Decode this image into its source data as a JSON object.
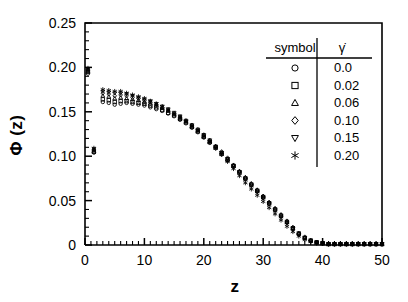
{
  "figure": {
    "background": "#ffffff",
    "foreground": "#000000"
  },
  "axes": {
    "x_label": "z",
    "y_label": "Φ (z)",
    "x_ticks": [
      "0",
      "10",
      "20",
      "30",
      "40",
      "50"
    ],
    "y_ticks": [
      "0",
      "0.05",
      "0.10",
      "0.15",
      "0.20",
      "0.25"
    ]
  },
  "legend": {
    "header_symbol": "symbol",
    "header_value": "γ̇",
    "rows": [
      {
        "marker": "circle-marker",
        "value": "0.0"
      },
      {
        "marker": "square-marker",
        "value": "0.02"
      },
      {
        "marker": "triangle-up-marker",
        "value": "0.06"
      },
      {
        "marker": "diamond-marker",
        "value": "0.10"
      },
      {
        "marker": "triangle-down-marker",
        "value": "0.15"
      },
      {
        "marker": "asterisk-marker",
        "value": "0.20"
      }
    ]
  },
  "chart_data": {
    "type": "scatter",
    "title": "",
    "xlabel": "z",
    "ylabel": "Φ (z)",
    "xlim": [
      0,
      50
    ],
    "ylim": [
      0,
      0.25
    ],
    "xticks": [
      0,
      10,
      20,
      30,
      40,
      50
    ],
    "yticks": [
      0,
      0.05,
      0.1,
      0.15,
      0.2,
      0.25
    ],
    "x_minor_tick_interval": 1,
    "y_minor_tick_interval": 0.01,
    "grid": false,
    "legend_position": "upper-right-inside",
    "marker_fill": "none",
    "marker_color": "#000000",
    "series": [
      {
        "name": "0.0",
        "marker": "circle",
        "x": [
          0.5,
          1.5,
          3,
          4,
          5,
          6,
          7,
          8,
          9,
          10,
          11,
          12,
          13,
          14,
          15,
          16,
          17,
          18,
          19,
          20,
          21,
          22,
          23,
          24,
          25,
          26,
          27,
          28,
          29,
          30,
          31,
          32,
          33,
          34,
          35,
          36,
          37,
          38,
          39,
          40,
          41,
          42,
          43,
          44,
          45,
          46,
          47,
          48,
          49,
          50
        ],
        "y": [
          0.193,
          0.104,
          0.161,
          0.16,
          0.158,
          0.159,
          0.16,
          0.159,
          0.158,
          0.157,
          0.155,
          0.153,
          0.151,
          0.148,
          0.145,
          0.141,
          0.137,
          0.132,
          0.127,
          0.121,
          0.115,
          0.109,
          0.102,
          0.095,
          0.088,
          0.081,
          0.074,
          0.067,
          0.06,
          0.053,
          0.046,
          0.039,
          0.032,
          0.025,
          0.018,
          0.012,
          0.008,
          0.005,
          0.003,
          0.002,
          0.001,
          0.001,
          0.001,
          0.001,
          0.001,
          0.001,
          0.001,
          0.001,
          0.001,
          0.001
        ]
      },
      {
        "name": "0.02",
        "marker": "square",
        "x": [
          0.5,
          1.5,
          3,
          4,
          5,
          6,
          7,
          8,
          9,
          10,
          11,
          12,
          13,
          14,
          15,
          16,
          17,
          18,
          19,
          20,
          21,
          22,
          23,
          24,
          25,
          26,
          27,
          28,
          29,
          30,
          31,
          32,
          33,
          34,
          35,
          36,
          37,
          38,
          39,
          40,
          41,
          42,
          43,
          44,
          45,
          46,
          47,
          48,
          49,
          50
        ],
        "y": [
          0.195,
          0.105,
          0.164,
          0.163,
          0.161,
          0.162,
          0.162,
          0.161,
          0.16,
          0.159,
          0.157,
          0.155,
          0.152,
          0.149,
          0.146,
          0.142,
          0.138,
          0.133,
          0.128,
          0.122,
          0.116,
          0.11,
          0.103,
          0.096,
          0.089,
          0.082,
          0.075,
          0.068,
          0.061,
          0.054,
          0.047,
          0.04,
          0.033,
          0.026,
          0.019,
          0.013,
          0.008,
          0.005,
          0.003,
          0.002,
          0.001,
          0.001,
          0.001,
          0.001,
          0.001,
          0.001,
          0.001,
          0.001,
          0.001,
          0.001
        ]
      },
      {
        "name": "0.06",
        "marker": "triangle-up",
        "x": [
          0.5,
          1.5,
          3,
          4,
          5,
          6,
          7,
          8,
          9,
          10,
          11,
          12,
          13,
          14,
          15,
          16,
          17,
          18,
          19,
          20,
          21,
          22,
          23,
          24,
          25,
          26,
          27,
          28,
          29,
          30,
          31,
          32,
          33,
          34,
          35,
          36,
          37,
          38,
          39,
          40,
          41,
          42,
          43,
          44,
          45,
          46,
          47,
          48,
          49,
          50
        ],
        "y": [
          0.196,
          0.106,
          0.168,
          0.167,
          0.165,
          0.166,
          0.165,
          0.164,
          0.163,
          0.161,
          0.159,
          0.157,
          0.154,
          0.151,
          0.147,
          0.143,
          0.139,
          0.134,
          0.129,
          0.123,
          0.117,
          0.111,
          0.104,
          0.097,
          0.09,
          0.083,
          0.076,
          0.069,
          0.062,
          0.055,
          0.048,
          0.041,
          0.034,
          0.026,
          0.019,
          0.013,
          0.008,
          0.005,
          0.003,
          0.002,
          0.001,
          0.001,
          0.001,
          0.001,
          0.001,
          0.001,
          0.001,
          0.001,
          0.001,
          0.001
        ]
      },
      {
        "name": "0.10",
        "marker": "diamond",
        "x": [
          0.5,
          1.5,
          3,
          4,
          5,
          6,
          7,
          8,
          9,
          10,
          11,
          12,
          13,
          14,
          15,
          16,
          17,
          18,
          19,
          20,
          21,
          22,
          23,
          24,
          25,
          26,
          27,
          28,
          29,
          30,
          31,
          32,
          33,
          34,
          35,
          36,
          37,
          38,
          39,
          40,
          41,
          42,
          43,
          44,
          45,
          46,
          47,
          48,
          49,
          50
        ],
        "y": [
          0.197,
          0.107,
          0.171,
          0.17,
          0.168,
          0.169,
          0.168,
          0.166,
          0.165,
          0.163,
          0.161,
          0.158,
          0.155,
          0.152,
          0.148,
          0.144,
          0.14,
          0.135,
          0.13,
          0.124,
          0.118,
          0.111,
          0.105,
          0.098,
          0.09,
          0.083,
          0.076,
          0.069,
          0.062,
          0.055,
          0.048,
          0.041,
          0.034,
          0.027,
          0.02,
          0.013,
          0.009,
          0.005,
          0.003,
          0.002,
          0.001,
          0.001,
          0.001,
          0.001,
          0.001,
          0.001,
          0.001,
          0.001,
          0.001,
          0.001
        ]
      },
      {
        "name": "0.15",
        "marker": "triangle-down",
        "x": [
          0.5,
          1.5,
          3,
          4,
          5,
          6,
          7,
          8,
          9,
          10,
          11,
          12,
          13,
          14,
          15,
          16,
          17,
          18,
          19,
          20,
          21,
          22,
          23,
          24,
          25,
          26,
          27,
          28,
          29,
          30,
          31,
          32,
          33,
          34,
          35,
          36,
          37,
          38,
          39,
          40,
          41,
          42,
          43,
          44,
          45,
          46,
          47,
          48,
          49,
          50
        ],
        "y": [
          0.198,
          0.108,
          0.173,
          0.172,
          0.171,
          0.171,
          0.17,
          0.168,
          0.166,
          0.164,
          0.162,
          0.159,
          0.156,
          0.153,
          0.149,
          0.145,
          0.14,
          0.135,
          0.13,
          0.124,
          0.118,
          0.111,
          0.104,
          0.097,
          0.089,
          0.082,
          0.074,
          0.067,
          0.06,
          0.053,
          0.046,
          0.039,
          0.032,
          0.025,
          0.018,
          0.012,
          0.008,
          0.004,
          0.003,
          0.002,
          0.001,
          0.001,
          0.001,
          0.001,
          0.001,
          0.001,
          0.001,
          0.001,
          0.001,
          0.001
        ]
      },
      {
        "name": "0.20",
        "marker": "asterisk",
        "x": [
          0.5,
          1.5,
          3,
          4,
          5,
          6,
          7,
          8,
          9,
          10,
          11,
          12,
          13,
          14,
          15,
          16,
          17,
          18,
          19,
          20,
          21,
          22,
          23,
          24,
          25,
          26,
          27,
          28,
          29,
          30,
          31,
          32,
          33,
          34,
          35,
          36,
          37,
          38,
          39,
          40,
          41,
          42,
          43,
          44,
          45,
          46,
          47,
          48,
          49,
          50
        ],
        "y": [
          0.199,
          0.109,
          0.175,
          0.174,
          0.173,
          0.173,
          0.171,
          0.169,
          0.167,
          0.165,
          0.162,
          0.159,
          0.156,
          0.152,
          0.148,
          0.144,
          0.139,
          0.134,
          0.128,
          0.122,
          0.116,
          0.109,
          0.102,
          0.094,
          0.086,
          0.078,
          0.07,
          0.063,
          0.056,
          0.049,
          0.042,
          0.035,
          0.028,
          0.021,
          0.015,
          0.01,
          0.006,
          0.004,
          0.002,
          0.002,
          0.001,
          0.001,
          0.001,
          0.001,
          0.001,
          0.001,
          0.001,
          0.001,
          0.001,
          0.001
        ]
      }
    ]
  }
}
